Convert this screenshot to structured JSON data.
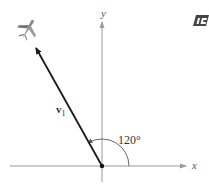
{
  "diagram": {
    "axes": {
      "x_label": "x",
      "y_label": "y"
    },
    "vector": {
      "label": "v",
      "subscript": "1",
      "direction_deg": 120
    },
    "angle_label": "120°",
    "colors": {
      "axis": "#9a9a9a",
      "vector": "#1a1a1a",
      "arc": "#555555"
    }
  }
}
